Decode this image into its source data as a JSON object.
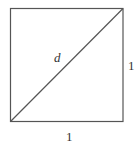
{
  "diagram": {
    "type": "geometry",
    "shape": "square",
    "labels": {
      "diagonal": "d",
      "right_side": "1",
      "bottom_side": "1"
    },
    "stroke_color": "#555555"
  }
}
